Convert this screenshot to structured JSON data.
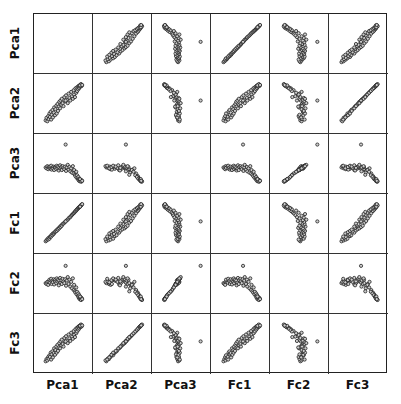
{
  "chart_data": {
    "type": "scatter",
    "subtype": "scatter_matrix",
    "title": "",
    "variables": [
      "Pca1",
      "Pca2",
      "Pca3",
      "Fc1",
      "Fc2",
      "Fc3"
    ],
    "diagonal": "empty",
    "marker": {
      "shape": "open-circle",
      "radius": 1.6,
      "stroke": "#222222",
      "fill": "#cccccc"
    },
    "grid": false,
    "axes_ticks": false,
    "value_range": [
      0,
      1
    ],
    "points": [
      {
        "Pca1": 0.08,
        "Pca2": 0.12,
        "Pca3": 0.42,
        "Fc1": 0.1,
        "Fc2": 0.52,
        "Fc3": 0.1
      },
      {
        "Pca1": 0.1,
        "Pca2": 0.18,
        "Pca3": 0.4,
        "Fc1": 0.12,
        "Fc2": 0.5,
        "Fc3": 0.15
      },
      {
        "Pca1": 0.12,
        "Pca2": 0.1,
        "Pca3": 0.45,
        "Fc1": 0.15,
        "Fc2": 0.55,
        "Fc3": 0.12
      },
      {
        "Pca1": 0.14,
        "Pca2": 0.22,
        "Pca3": 0.38,
        "Fc1": 0.14,
        "Fc2": 0.48,
        "Fc3": 0.2
      },
      {
        "Pca1": 0.15,
        "Pca2": 0.15,
        "Pca3": 0.43,
        "Fc1": 0.18,
        "Fc2": 0.56,
        "Fc3": 0.16
      },
      {
        "Pca1": 0.17,
        "Pca2": 0.28,
        "Pca3": 0.41,
        "Fc1": 0.16,
        "Fc2": 0.6,
        "Fc3": 0.24
      },
      {
        "Pca1": 0.18,
        "Pca2": 0.2,
        "Pca3": 0.44,
        "Fc1": 0.2,
        "Fc2": 0.53,
        "Fc3": 0.2
      },
      {
        "Pca1": 0.2,
        "Pca2": 0.32,
        "Pca3": 0.39,
        "Fc1": 0.22,
        "Fc2": 0.58,
        "Fc3": 0.3
      },
      {
        "Pca1": 0.21,
        "Pca2": 0.14,
        "Pca3": 0.46,
        "Fc1": 0.21,
        "Fc2": 0.62,
        "Fc3": 0.14
      },
      {
        "Pca1": 0.22,
        "Pca2": 0.25,
        "Pca3": 0.37,
        "Fc1": 0.25,
        "Fc2": 0.5,
        "Fc3": 0.26
      },
      {
        "Pca1": 0.24,
        "Pca2": 0.36,
        "Pca3": 0.42,
        "Fc1": 0.24,
        "Fc2": 0.57,
        "Fc3": 0.33
      },
      {
        "Pca1": 0.25,
        "Pca2": 0.19,
        "Pca3": 0.4,
        "Fc1": 0.28,
        "Fc2": 0.54,
        "Fc3": 0.19
      },
      {
        "Pca1": 0.27,
        "Pca2": 0.3,
        "Pca3": 0.44,
        "Fc1": 0.27,
        "Fc2": 0.61,
        "Fc3": 0.29
      },
      {
        "Pca1": 0.28,
        "Pca2": 0.42,
        "Pca3": 0.36,
        "Fc1": 0.3,
        "Fc2": 0.49,
        "Fc3": 0.4
      },
      {
        "Pca1": 0.3,
        "Pca2": 0.24,
        "Pca3": 0.43,
        "Fc1": 0.31,
        "Fc2": 0.59,
        "Fc3": 0.25
      },
      {
        "Pca1": 0.31,
        "Pca2": 0.38,
        "Pca3": 0.41,
        "Fc1": 0.33,
        "Fc2": 0.55,
        "Fc3": 0.36
      },
      {
        "Pca1": 0.33,
        "Pca2": 0.46,
        "Pca3": 0.38,
        "Fc1": 0.35,
        "Fc2": 0.52,
        "Fc3": 0.44
      },
      {
        "Pca1": 0.34,
        "Pca2": 0.28,
        "Pca3": 0.46,
        "Fc1": 0.34,
        "Fc2": 0.63,
        "Fc3": 0.3
      },
      {
        "Pca1": 0.36,
        "Pca2": 0.5,
        "Pca3": 0.4,
        "Fc1": 0.38,
        "Fc2": 0.56,
        "Fc3": 0.48
      },
      {
        "Pca1": 0.37,
        "Pca2": 0.34,
        "Pca3": 0.44,
        "Fc1": 0.37,
        "Fc2": 0.6,
        "Fc3": 0.34
      },
      {
        "Pca1": 0.39,
        "Pca2": 0.44,
        "Pca3": 0.35,
        "Fc1": 0.41,
        "Fc2": 0.47,
        "Fc3": 0.42
      },
      {
        "Pca1": 0.4,
        "Pca2": 0.55,
        "Pca3": 0.42,
        "Fc1": 0.4,
        "Fc2": 0.58,
        "Fc3": 0.52
      },
      {
        "Pca1": 0.42,
        "Pca2": 0.4,
        "Pca3": 0.47,
        "Fc1": 0.44,
        "Fc2": 0.64,
        "Fc3": 0.4
      },
      {
        "Pca1": 0.43,
        "Pca2": 0.58,
        "Pca3": 0.39,
        "Fc1": 0.43,
        "Fc2": 0.53,
        "Fc3": 0.56
      },
      {
        "Pca1": 0.45,
        "Pca2": 0.48,
        "Pca3": 0.43,
        "Fc1": 0.47,
        "Fc2": 0.59,
        "Fc3": 0.47
      },
      {
        "Pca1": 0.46,
        "Pca2": 0.62,
        "Pca3": 0.36,
        "Fc1": 0.46,
        "Fc2": 0.5,
        "Fc3": 0.6
      },
      {
        "Pca1": 0.48,
        "Pca2": 0.52,
        "Pca3": 0.45,
        "Fc1": 0.5,
        "Fc2": 0.62,
        "Fc3": 0.5
      },
      {
        "Pca1": 0.5,
        "Pca2": 0.45,
        "Pca3": 0.41,
        "Fc1": 0.51,
        "Fc2": 0.56,
        "Fc3": 0.44
      },
      {
        "Pca1": 0.52,
        "Pca2": 0.66,
        "Pca3": 0.38,
        "Fc1": 0.53,
        "Fc2": 0.52,
        "Fc3": 0.64
      },
      {
        "Pca1": 0.54,
        "Pca2": 0.56,
        "Pca3": 0.44,
        "Fc1": 0.55,
        "Fc2": 0.61,
        "Fc3": 0.55
      },
      {
        "Pca1": 0.56,
        "Pca2": 0.7,
        "Pca3": 0.34,
        "Fc1": 0.57,
        "Fc2": 0.46,
        "Fc3": 0.68
      },
      {
        "Pca1": 0.58,
        "Pca2": 0.6,
        "Pca3": 0.42,
        "Fc1": 0.59,
        "Fc2": 0.58,
        "Fc3": 0.58
      },
      {
        "Pca1": 0.6,
        "Pca2": 0.52,
        "Pca3": 0.48,
        "Fc1": 0.6,
        "Fc2": 0.66,
        "Fc3": 0.52
      },
      {
        "Pca1": 0.62,
        "Pca2": 0.74,
        "Pca3": 0.37,
        "Fc1": 0.63,
        "Fc2": 0.5,
        "Fc3": 0.72
      },
      {
        "Pca1": 0.64,
        "Pca2": 0.64,
        "Pca3": 0.43,
        "Fc1": 0.65,
        "Fc2": 0.6,
        "Fc3": 0.63
      },
      {
        "Pca1": 0.66,
        "Pca2": 0.58,
        "Pca3": 0.33,
        "Fc1": 0.66,
        "Fc2": 0.44,
        "Fc3": 0.57
      },
      {
        "Pca1": 0.68,
        "Pca2": 0.78,
        "Pca3": 0.4,
        "Fc1": 0.69,
        "Fc2": 0.55,
        "Fc3": 0.76
      },
      {
        "Pca1": 0.7,
        "Pca2": 0.68,
        "Pca3": 0.3,
        "Fc1": 0.71,
        "Fc2": 0.4,
        "Fc3": 0.67
      },
      {
        "Pca1": 0.72,
        "Pca2": 0.62,
        "Pca3": 0.45,
        "Fc1": 0.73,
        "Fc2": 0.63,
        "Fc3": 0.62
      },
      {
        "Pca1": 0.74,
        "Pca2": 0.82,
        "Pca3": 0.28,
        "Fc1": 0.75,
        "Fc2": 0.36,
        "Fc3": 0.8
      },
      {
        "Pca1": 0.75,
        "Pca2": 0.72,
        "Pca3": 0.36,
        "Fc1": 0.76,
        "Fc2": 0.48,
        "Fc3": 0.71
      },
      {
        "Pca1": 0.77,
        "Pca2": 0.66,
        "Pca3": 0.25,
        "Fc1": 0.78,
        "Fc2": 0.33,
        "Fc3": 0.66
      },
      {
        "Pca1": 0.78,
        "Pca2": 0.86,
        "Pca3": 0.22,
        "Fc1": 0.8,
        "Fc2": 0.3,
        "Fc3": 0.84
      },
      {
        "Pca1": 0.8,
        "Pca2": 0.76,
        "Pca3": 0.32,
        "Fc1": 0.81,
        "Fc2": 0.42,
        "Fc3": 0.75
      },
      {
        "Pca1": 0.81,
        "Pca2": 0.88,
        "Pca3": 0.18,
        "Fc1": 0.83,
        "Fc2": 0.26,
        "Fc3": 0.87
      },
      {
        "Pca1": 0.82,
        "Pca2": 0.8,
        "Pca3": 0.24,
        "Fc1": 0.84,
        "Fc2": 0.32,
        "Fc3": 0.79
      },
      {
        "Pca1": 0.84,
        "Pca2": 0.9,
        "Pca3": 0.15,
        "Fc1": 0.86,
        "Fc2": 0.22,
        "Fc3": 0.89
      },
      {
        "Pca1": 0.85,
        "Pca2": 0.84,
        "Pca3": 0.2,
        "Fc1": 0.87,
        "Fc2": 0.28,
        "Fc3": 0.83
      },
      {
        "Pca1": 0.86,
        "Pca2": 0.92,
        "Pca3": 0.12,
        "Fc1": 0.88,
        "Fc2": 0.18,
        "Fc3": 0.91
      },
      {
        "Pca1": 0.87,
        "Pca2": 0.87,
        "Pca3": 0.16,
        "Fc1": 0.89,
        "Fc2": 0.24,
        "Fc3": 0.86
      },
      {
        "Pca1": 0.88,
        "Pca2": 0.93,
        "Pca3": 0.1,
        "Fc1": 0.9,
        "Fc2": 0.15,
        "Fc3": 0.92
      },
      {
        "Pca1": 0.89,
        "Pca2": 0.9,
        "Pca3": 0.14,
        "Fc1": 0.91,
        "Fc2": 0.2,
        "Fc3": 0.89
      },
      {
        "Pca1": 0.9,
        "Pca2": 0.94,
        "Pca3": 0.11,
        "Fc1": 0.92,
        "Fc2": 0.16,
        "Fc3": 0.93
      },
      {
        "Pca1": 0.91,
        "Pca2": 0.91,
        "Pca3": 0.13,
        "Fc1": 0.93,
        "Fc2": 0.19,
        "Fc3": 0.9
      },
      {
        "Pca1": 0.92,
        "Pca2": 0.95,
        "Pca3": 0.09,
        "Fc1": 0.94,
        "Fc2": 0.14,
        "Fc3": 0.94
      },
      {
        "Pca1": 0.93,
        "Pca2": 0.92,
        "Pca3": 0.12,
        "Fc1": 0.95,
        "Fc2": 0.17,
        "Fc3": 0.91
      },
      {
        "Pca1": 0.91,
        "Pca2": 0.96,
        "Pca3": 0.1,
        "Fc1": 0.93,
        "Fc2": 0.13,
        "Fc3": 0.95
      },
      {
        "Pca1": 0.89,
        "Pca2": 0.93,
        "Pca3": 0.15,
        "Fc1": 0.9,
        "Fc2": 0.21,
        "Fc3": 0.92
      },
      {
        "Pca1": 0.94,
        "Pca2": 0.94,
        "Pca3": 0.11,
        "Fc1": 0.96,
        "Fc2": 0.15,
        "Fc3": 0.93
      },
      {
        "Pca1": 0.55,
        "Pca2": 0.58,
        "Pca3": 0.95,
        "Fc1": 0.56,
        "Fc2": 0.92,
        "Fc3": 0.56
      }
    ]
  },
  "labels": {
    "rows": [
      "Pca1",
      "Pca2",
      "Pca3",
      "Fc1",
      "Fc2",
      "Fc3"
    ],
    "cols": [
      "Pca1",
      "Pca2",
      "Pca3",
      "Fc1",
      "Fc2",
      "Fc3"
    ]
  }
}
